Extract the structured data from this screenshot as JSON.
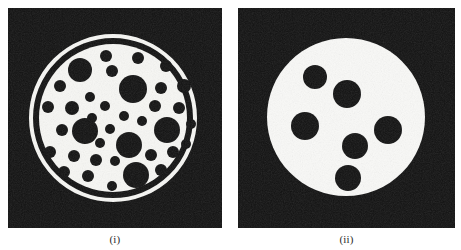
{
  "figure": {
    "background_color": "#ffffff",
    "width": 461,
    "height": 250
  },
  "panels": [
    {
      "id": "panel-i",
      "caption": "(i)",
      "frame": {
        "x": 8,
        "y": 8,
        "width": 214,
        "height": 220
      },
      "background_color": "#111111",
      "foreground_color": "#f7f7f4",
      "description": "Dark square field containing a light disc enclosed by a thin outer ring, filled with many dark circular inclusions",
      "outer_ring": {
        "cx": 113,
        "cy": 118,
        "r": 82,
        "stroke_width": 4
      },
      "inner_gap": {
        "cx": 113,
        "cy": 118,
        "r": 77,
        "stroke_width": 2
      },
      "disc": {
        "cx": 113,
        "cy": 118,
        "r": 74
      },
      "dot_count": 37,
      "dots": [
        {
          "cx": 106,
          "cy": 56,
          "r": 6
        },
        {
          "cx": 138,
          "cy": 58,
          "r": 6
        },
        {
          "cx": 166,
          "cy": 66,
          "r": 6
        },
        {
          "cx": 80,
          "cy": 70,
          "r": 12
        },
        {
          "cx": 112,
          "cy": 71,
          "r": 6
        },
        {
          "cx": 60,
          "cy": 86,
          "r": 6
        },
        {
          "cx": 133,
          "cy": 89,
          "r": 14
        },
        {
          "cx": 161,
          "cy": 88,
          "r": 6
        },
        {
          "cx": 184,
          "cy": 86,
          "r": 7
        },
        {
          "cx": 90,
          "cy": 97,
          "r": 5
        },
        {
          "cx": 48,
          "cy": 107,
          "r": 6
        },
        {
          "cx": 72,
          "cy": 108,
          "r": 7
        },
        {
          "cx": 105,
          "cy": 106,
          "r": 5
        },
        {
          "cx": 155,
          "cy": 106,
          "r": 6
        },
        {
          "cx": 179,
          "cy": 108,
          "r": 6
        },
        {
          "cx": 92,
          "cy": 118,
          "r": 5
        },
        {
          "cx": 124,
          "cy": 116,
          "r": 5
        },
        {
          "cx": 142,
          "cy": 121,
          "r": 5
        },
        {
          "cx": 62,
          "cy": 130,
          "r": 6
        },
        {
          "cx": 85,
          "cy": 131,
          "r": 13
        },
        {
          "cx": 110,
          "cy": 129,
          "r": 5
        },
        {
          "cx": 167,
          "cy": 130,
          "r": 13
        },
        {
          "cx": 191,
          "cy": 124,
          "r": 5
        },
        {
          "cx": 100,
          "cy": 143,
          "r": 5
        },
        {
          "cx": 129,
          "cy": 145,
          "r": 13
        },
        {
          "cx": 50,
          "cy": 152,
          "r": 6
        },
        {
          "cx": 74,
          "cy": 156,
          "r": 6
        },
        {
          "cx": 96,
          "cy": 160,
          "r": 6
        },
        {
          "cx": 115,
          "cy": 161,
          "r": 5
        },
        {
          "cx": 151,
          "cy": 155,
          "r": 6
        },
        {
          "cx": 173,
          "cy": 152,
          "r": 6
        },
        {
          "cx": 186,
          "cy": 144,
          "r": 5
        },
        {
          "cx": 64,
          "cy": 172,
          "r": 6
        },
        {
          "cx": 88,
          "cy": 176,
          "r": 6
        },
        {
          "cx": 136,
          "cy": 175,
          "r": 13
        },
        {
          "cx": 161,
          "cy": 170,
          "r": 6
        },
        {
          "cx": 112,
          "cy": 186,
          "r": 5
        }
      ]
    },
    {
      "id": "panel-ii",
      "caption": "(ii)",
      "frame": {
        "x": 238,
        "y": 8,
        "width": 217,
        "height": 220
      },
      "background_color": "#111111",
      "foreground_color": "#f9f9f7",
      "description": "Dark square field containing a large light disc with six dark circular inclusions",
      "disc": {
        "cx": 346,
        "cy": 117,
        "r": 79
      },
      "dot_count": 6,
      "dots": [
        {
          "cx": 315,
          "cy": 77,
          "r": 12
        },
        {
          "cx": 347,
          "cy": 94,
          "r": 14
        },
        {
          "cx": 305,
          "cy": 126,
          "r": 14
        },
        {
          "cx": 388,
          "cy": 130,
          "r": 14
        },
        {
          "cx": 355,
          "cy": 146,
          "r": 13
        },
        {
          "cx": 348,
          "cy": 178,
          "r": 13
        }
      ]
    }
  ]
}
